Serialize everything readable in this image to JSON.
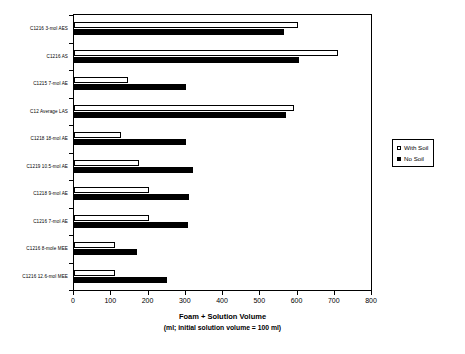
{
  "chart_data": {
    "type": "bar",
    "orientation": "horizontal",
    "title": "",
    "xlabel": "Foam + Solution Volume (ml; initial solution volume = 100 ml)",
    "xlabel_line1": "Foam + Solution Volume",
    "xlabel_line2": "(ml; initial solution volume = 100 ml)",
    "ylabel": "",
    "xlim": [
      0,
      800
    ],
    "xticks": [
      0,
      100,
      200,
      300,
      400,
      500,
      600,
      700,
      800
    ],
    "xticklabels": [
      "0",
      "100",
      "200",
      "300",
      "400",
      "500",
      "600",
      "700",
      "800"
    ],
    "grid": false,
    "legend_position": "right",
    "categories": [
      "C1216 3-mol AES",
      "C1216 AS",
      "C1215 7-mol AE",
      "C12 Average LAS",
      "C1218 18-mol AE",
      "C1219 10.5-mol AE",
      "C1218 9-mol AE",
      "C1216 7-mol AE",
      "C1216 8-mole MEE",
      "C1216 12.6-mol MEE"
    ],
    "series": [
      {
        "name": "With Soil",
        "color": "#ffffff",
        "edge_color": "#000000",
        "values": [
          600,
          710,
          145,
          590,
          125,
          175,
          200,
          200,
          110,
          110
        ]
      },
      {
        "name": "No Soil",
        "color": "#000000",
        "edge_color": "#000000",
        "values": [
          565,
          605,
          300,
          570,
          300,
          320,
          310,
          305,
          170,
          250
        ]
      }
    ]
  },
  "legend": {
    "items": [
      {
        "label": "With Soil",
        "swatch": "hollow"
      },
      {
        "label": "No Soil",
        "swatch": "filled"
      }
    ]
  }
}
